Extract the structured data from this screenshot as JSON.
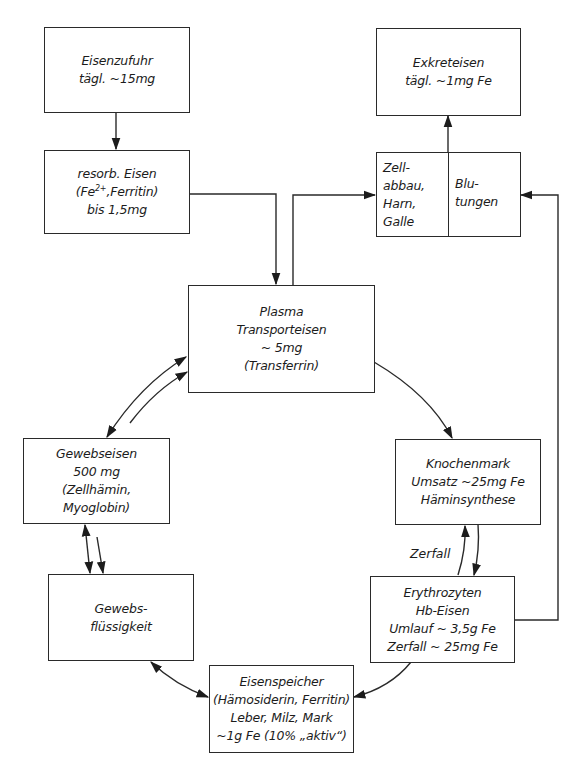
{
  "diagram": {
    "type": "flowchart",
    "nodes": {
      "intake": {
        "lines": [
          "Eisenzufuhr",
          "tägl. ~15mg"
        ]
      },
      "absorbed": {
        "lines": [
          "resorb. Eisen",
          "(Fe2+,Ferritin)",
          "bis 1,5mg"
        ],
        "superscript": "2+"
      },
      "excretion": {
        "lines": [
          "Exkreteisen",
          "tägl. ~1mg Fe"
        ]
      },
      "losses_left": {
        "lines": [
          "Zell-",
          "abbau,",
          "Harn,",
          "Galle"
        ]
      },
      "losses_right": {
        "lines": [
          "Blu-",
          "tungen"
        ]
      },
      "plasma": {
        "lines": [
          "Plasma",
          "Transporteisen",
          "~ 5mg",
          "(Transferrin)"
        ]
      },
      "tissue_iron": {
        "lines": [
          "Gewebseisen",
          "500 mg",
          "(Zellhämin,",
          "Myoglobin)"
        ]
      },
      "bone_marrow": {
        "lines": [
          "Knochenmark",
          "Umsatz ~25mg Fe",
          "Häminsynthese"
        ]
      },
      "tissue_fluid": {
        "lines": [
          "Gewebs-",
          "flüssigkeit"
        ]
      },
      "erythrocytes": {
        "lines": [
          "Erythrozyten",
          "Hb-Eisen",
          "Umlauf ~ 3,5g Fe",
          "Zerfall ~ 25mg Fe"
        ]
      },
      "storage": {
        "lines": [
          "Eisenspeicher",
          "(Hämosiderin, Ferritin)",
          "Leber, Milz, Mark",
          "~1g Fe (10% „aktiv“)"
        ]
      }
    },
    "edge_labels": {
      "breakdown": "Zerfall"
    },
    "edges": [
      {
        "from": "intake",
        "to": "absorbed"
      },
      {
        "from": "absorbed",
        "to": "plasma"
      },
      {
        "from": "plasma",
        "to": "losses_left"
      },
      {
        "from": "losses",
        "to": "excretion"
      },
      {
        "from": "erythrocytes",
        "to": "losses_right"
      },
      {
        "from": "plasma",
        "to": "bone_marrow"
      },
      {
        "from": "bone_marrow",
        "to": "erythrocytes"
      },
      {
        "from": "erythrocytes",
        "to": "bone_marrow",
        "label": "Zerfall"
      },
      {
        "from": "erythrocytes",
        "to": "storage"
      },
      {
        "from": "plasma",
        "to": "tissue_iron",
        "bidirectional": true
      },
      {
        "from": "tissue_iron",
        "to": "tissue_fluid",
        "bidirectional": true
      },
      {
        "from": "tissue_fluid",
        "to": "storage",
        "bidirectional": true
      }
    ]
  }
}
